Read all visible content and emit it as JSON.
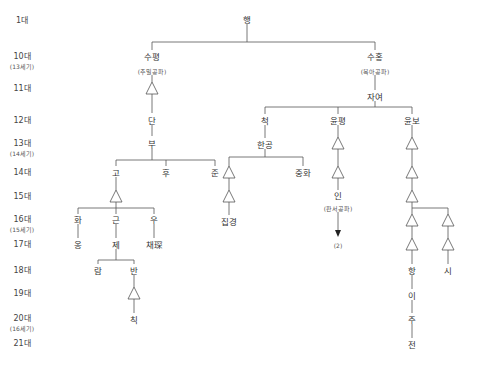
{
  "generations": [
    {
      "label": "1대",
      "y": 20
    },
    {
      "label": "10대",
      "sub": "(13세기)",
      "y": 56
    },
    {
      "label": "11대",
      "y": 88
    },
    {
      "label": "12대",
      "y": 120
    },
    {
      "label": "13대",
      "sub": "(14세기)",
      "y": 143
    },
    {
      "label": "14대",
      "y": 172
    },
    {
      "label": "15대",
      "y": 196
    },
    {
      "label": "16대",
      "sub": "(15세기)",
      "y": 219
    },
    {
      "label": "17대",
      "y": 244
    },
    {
      "label": "18대",
      "y": 270
    },
    {
      "label": "19대",
      "y": 293
    },
    {
      "label": "20대",
      "sub": "(16세기)",
      "y": 318
    },
    {
      "label": "21대",
      "y": 343
    }
  ],
  "nodes": [
    {
      "id": "haeng",
      "label": "행",
      "x": 247,
      "y": 20
    },
    {
      "id": "supyeong",
      "label": "수평",
      "x": 152,
      "y": 57
    },
    {
      "id": "supyeong-branch",
      "label": "(추밀공파)",
      "x": 152,
      "y": 71,
      "small": true
    },
    {
      "id": "dan",
      "label": "단",
      "x": 152,
      "y": 121
    },
    {
      "id": "bu",
      "label": "부",
      "x": 152,
      "y": 144
    },
    {
      "id": "go",
      "label": "고",
      "x": 116,
      "y": 173
    },
    {
      "id": "hu",
      "label": "후",
      "x": 166,
      "y": 173
    },
    {
      "id": "jun",
      "label": "준",
      "x": 215,
      "y": 173
    },
    {
      "id": "hwa",
      "label": "화",
      "x": 78,
      "y": 220
    },
    {
      "id": "geun",
      "label": "근",
      "x": 116,
      "y": 220
    },
    {
      "id": "u",
      "label": "우",
      "x": 154,
      "y": 220
    },
    {
      "id": "ong",
      "label": "옹",
      "x": 78,
      "y": 245
    },
    {
      "id": "je",
      "label": "제",
      "x": 116,
      "y": 245
    },
    {
      "id": "chae",
      "label": "채琛",
      "x": 154,
      "y": 245
    },
    {
      "id": "ram",
      "label": "람",
      "x": 98,
      "y": 271
    },
    {
      "id": "ban",
      "label": "반",
      "x": 134,
      "y": 271
    },
    {
      "id": "chik",
      "label": "칙",
      "x": 134,
      "y": 320
    },
    {
      "id": "suhong",
      "label": "수홍",
      "x": 375,
      "y": 57
    },
    {
      "id": "suhong-branch",
      "label": "(복아공파)",
      "x": 375,
      "y": 71,
      "small": true
    },
    {
      "id": "jayeo",
      "label": "자여",
      "x": 375,
      "y": 97
    },
    {
      "id": "cheok",
      "label": "척",
      "x": 265,
      "y": 121
    },
    {
      "id": "yunpyeong",
      "label": "윤평",
      "x": 338,
      "y": 121
    },
    {
      "id": "yunbo",
      "label": "윤보",
      "x": 412,
      "y": 121
    },
    {
      "id": "hangong",
      "label": "한공",
      "x": 265,
      "y": 145
    },
    {
      "id": "jipgyeong",
      "label": "집경",
      "x": 229,
      "y": 222
    },
    {
      "id": "junghwa",
      "label": "중화",
      "x": 303,
      "y": 173
    },
    {
      "id": "in",
      "label": "인",
      "x": 338,
      "y": 196
    },
    {
      "id": "in-branch",
      "label": "(판서공파)",
      "x": 338,
      "y": 208,
      "small": true
    },
    {
      "id": "note-2",
      "label": "(2)",
      "x": 338,
      "y": 245,
      "small": true
    },
    {
      "id": "hang",
      "label": "항",
      "x": 412,
      "y": 271
    },
    {
      "id": "si",
      "label": "시",
      "x": 448,
      "y": 271
    },
    {
      "id": "i",
      "label": "이",
      "x": 412,
      "y": 296
    },
    {
      "id": "ju",
      "label": "주",
      "x": 412,
      "y": 320
    },
    {
      "id": "jeon",
      "label": "전",
      "x": 412,
      "y": 345
    }
  ],
  "triangles": [
    {
      "x": 152,
      "y": 88
    },
    {
      "x": 116,
      "y": 196
    },
    {
      "x": 134,
      "y": 293
    },
    {
      "x": 229,
      "y": 172
    },
    {
      "x": 229,
      "y": 196
    },
    {
      "x": 338,
      "y": 143
    },
    {
      "x": 338,
      "y": 172
    },
    {
      "x": 412,
      "y": 143
    },
    {
      "x": 412,
      "y": 172
    },
    {
      "x": 412,
      "y": 196
    },
    {
      "x": 412,
      "y": 220
    },
    {
      "x": 412,
      "y": 244
    },
    {
      "x": 448,
      "y": 220
    },
    {
      "x": 448,
      "y": 244
    }
  ],
  "colors": {
    "line": "#555555",
    "text": "#333333",
    "background": "#ffffff"
  }
}
